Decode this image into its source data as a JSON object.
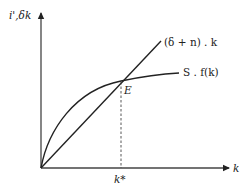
{
  "diagram": {
    "y_axis_label": "i',δk",
    "x_axis_label": "k",
    "line_label": "(δ + n) . k",
    "curve_label": "S . f(k)",
    "equilibrium_label": "E",
    "equilibrium_k_label": "k*",
    "colors": {
      "stroke": "#222222",
      "background": "#ffffff"
    }
  }
}
